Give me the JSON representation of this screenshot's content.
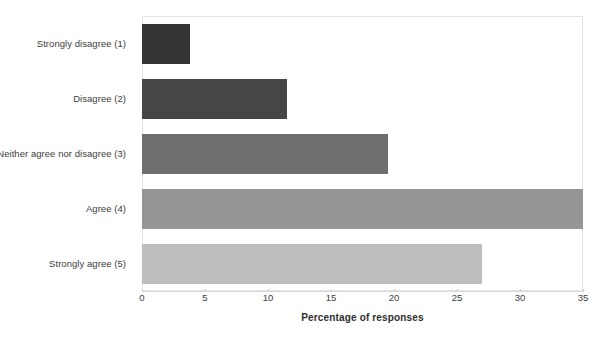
{
  "chart_data": {
    "type": "bar",
    "orientation": "horizontal",
    "title": "",
    "xlabel": "Percentage of responses",
    "ylabel": "",
    "categories": [
      "Strongly disagree (1)",
      "Disagree (2)",
      "Neither agree nor disagree (3)",
      "Agree (4)",
      "Strongly agree (5)"
    ],
    "values": [
      3.8,
      11.5,
      19.5,
      36.5,
      27.0
    ],
    "bar_colors": [
      "#333333",
      "#464646",
      "#6e6e6e",
      "#969696",
      "#bdbdbd"
    ],
    "xlim": [
      0,
      35
    ],
    "xticks": [
      0,
      5,
      10,
      15,
      20,
      25,
      30,
      35
    ],
    "xtick_labels": [
      "0",
      "5",
      "10",
      "15",
      "20",
      "25",
      "30",
      "35"
    ],
    "grid": false,
    "legend": "none",
    "plot_border_color": "#e3e3e3",
    "axis_color": "#d9d9d9",
    "text_color": "#3d3d3d"
  },
  "cropped_title": {
    "text": "",
    "note_visible": ""
  }
}
